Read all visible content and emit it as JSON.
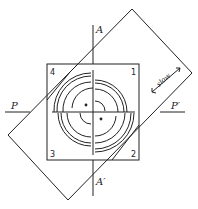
{
  "diagram": {
    "labels": {
      "axis_top": "A",
      "axis_bottom": "A′",
      "axis_left": "P",
      "axis_right": "P′",
      "direction": "slow"
    },
    "quadrants": [
      "1",
      "2",
      "3",
      "4"
    ],
    "colors": {
      "ink": "#222222",
      "background": "#ffffff"
    }
  }
}
